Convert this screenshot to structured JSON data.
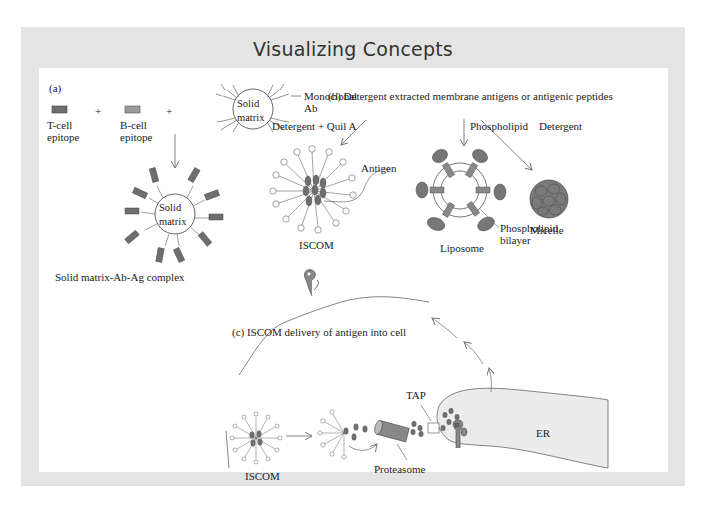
{
  "title": "Visualizing Concepts",
  "colors": {
    "frame_gray": "#e4e4e4",
    "panel_white": "#ffffff",
    "antigen_dark": "#6e6e6e",
    "epitope_light": "#9a9a9a",
    "er_fill": "#ececec",
    "line": "#555555"
  },
  "panel_a": {
    "label": "(a)",
    "t_cell_epitope": [
      "T-cell",
      "epitope"
    ],
    "b_cell_epitope": [
      "B-cell",
      "epitope"
    ],
    "plus": "+",
    "solid_matrix": [
      "Solid",
      "matrix"
    ],
    "monoclonal_ab": [
      "Monoclonal",
      "Ab"
    ],
    "complex_label": "Solid matrix-Ab-Ag complex"
  },
  "panel_b": {
    "label": "(b)  Detergent extracted membrane antigens or antigenic peptides",
    "arrow_detergent_quil": "Detergent + Quil A",
    "arrow_phospholipid": "Phospholipid",
    "arrow_detergent": "Detergent",
    "antigen": "Antigen",
    "iscom": "ISCOM",
    "liposome": "Liposome",
    "phospholipid_bilayer": [
      "Phospholipid",
      "bilayer"
    ],
    "micelle": "Micelle"
  },
  "panel_c": {
    "label": "(c)  ISCOM delivery of antigen into cell",
    "iscom": "ISCOM",
    "tap": "TAP",
    "proteasome": "Proteasome",
    "er": "ER"
  }
}
